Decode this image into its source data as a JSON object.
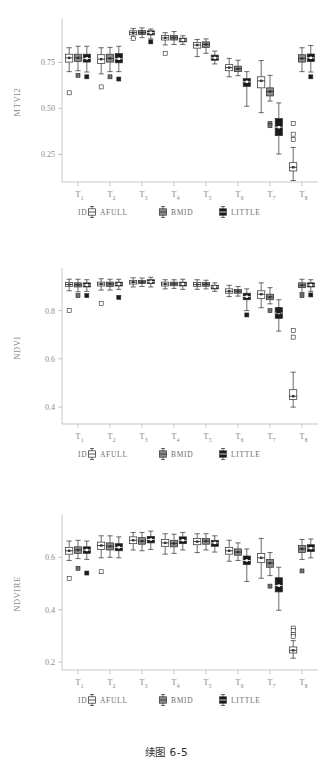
{
  "figure": {
    "caption": "续图 6-5",
    "legend": {
      "title": "ID",
      "items": [
        {
          "label": "AFULL",
          "fill": "#ffffff"
        },
        {
          "label": "BMID",
          "fill": "#8c8c8c"
        },
        {
          "label": "LITTLE",
          "fill": "#1a1a1a"
        }
      ]
    },
    "x_categories": [
      "T",
      "T",
      "T",
      "T",
      "T",
      "T",
      "T",
      "T"
    ],
    "x_subscripts": [
      "1",
      "2",
      "3",
      "4",
      "5",
      "6",
      "7",
      "8"
    ]
  },
  "chart_data": [
    {
      "type": "box",
      "title": "",
      "xlabel": "",
      "ylabel": "MTVI2",
      "ylim": [
        0.1,
        0.97
      ],
      "yticks": [
        0.25,
        0.5,
        0.75
      ],
      "ytick_labels": [
        "0.25",
        "0.50",
        "0.75"
      ],
      "grid": false,
      "legend_position": "bottom",
      "categories": [
        "T1",
        "T2",
        "T3",
        "T4",
        "T5",
        "T6",
        "T7",
        "T8"
      ],
      "series": [
        {
          "name": "AFULL",
          "boxes": [
            {
              "min": 0.7,
              "q1": 0.752,
              "med": 0.775,
              "q3": 0.795,
              "max": 0.83,
              "outliers": [
                0.585
              ]
            },
            {
              "min": 0.688,
              "q1": 0.745,
              "med": 0.768,
              "q3": 0.792,
              "max": 0.83,
              "outliers": [
                0.617
              ]
            },
            {
              "min": 0.88,
              "q1": 0.9,
              "med": 0.912,
              "q3": 0.922,
              "max": 0.935,
              "outliers": [
                0.88
              ]
            },
            {
              "min": 0.845,
              "q1": 0.872,
              "med": 0.884,
              "q3": 0.896,
              "max": 0.912,
              "outliers": [
                0.8
              ]
            },
            {
              "min": 0.782,
              "q1": 0.828,
              "med": 0.845,
              "q3": 0.858,
              "max": 0.875,
              "outliers": []
            },
            {
              "min": 0.672,
              "q1": 0.705,
              "med": 0.722,
              "q3": 0.738,
              "max": 0.772,
              "outliers": []
            },
            {
              "min": 0.477,
              "q1": 0.612,
              "med": 0.65,
              "q3": 0.672,
              "max": 0.76,
              "outliers": []
            },
            {
              "min": 0.108,
              "q1": 0.16,
              "med": 0.18,
              "q3": 0.205,
              "max": 0.288,
              "outliers": [
                0.418,
                0.36,
                0.332
              ]
            }
          ]
        },
        {
          "name": "BMID",
          "boxes": [
            {
              "min": 0.705,
              "q1": 0.755,
              "med": 0.775,
              "q3": 0.795,
              "max": 0.838,
              "outliers": [
                0.68
              ]
            },
            {
              "min": 0.7,
              "q1": 0.752,
              "med": 0.772,
              "q3": 0.795,
              "max": 0.832,
              "outliers": [
                0.672
              ]
            },
            {
              "min": 0.885,
              "q1": 0.902,
              "med": 0.912,
              "q3": 0.924,
              "max": 0.938,
              "outliers": []
            },
            {
              "min": 0.848,
              "q1": 0.872,
              "med": 0.885,
              "q3": 0.896,
              "max": 0.918,
              "outliers": []
            },
            {
              "min": 0.8,
              "q1": 0.832,
              "med": 0.848,
              "q3": 0.862,
              "max": 0.878,
              "outliers": []
            },
            {
              "min": 0.678,
              "q1": 0.7,
              "med": 0.715,
              "q3": 0.73,
              "max": 0.762,
              "outliers": []
            },
            {
              "min": 0.54,
              "q1": 0.568,
              "med": 0.592,
              "q3": 0.612,
              "max": 0.68,
              "outliers": [
                0.418,
                0.406
              ]
            },
            {
              "min": 0.7,
              "q1": 0.752,
              "med": 0.772,
              "q3": 0.792,
              "max": 0.83,
              "outliers": []
            }
          ]
        },
        {
          "name": "LITTLE",
          "boxes": [
            {
              "min": 0.698,
              "q1": 0.752,
              "med": 0.772,
              "q3": 0.795,
              "max": 0.838,
              "outliers": [
                0.672
              ]
            },
            {
              "min": 0.7,
              "q1": 0.748,
              "med": 0.77,
              "q3": 0.798,
              "max": 0.838,
              "outliers": [
                0.66
              ]
            },
            {
              "min": 0.878,
              "q1": 0.9,
              "med": 0.912,
              "q3": 0.922,
              "max": 0.932,
              "outliers": [
                0.862
              ]
            },
            {
              "min": 0.848,
              "q1": 0.862,
              "med": 0.872,
              "q3": 0.882,
              "max": 0.895,
              "outliers": []
            },
            {
              "min": 0.742,
              "q1": 0.762,
              "med": 0.775,
              "q3": 0.79,
              "max": 0.812,
              "outliers": []
            },
            {
              "min": 0.512,
              "q1": 0.62,
              "med": 0.645,
              "q3": 0.662,
              "max": 0.7,
              "outliers": []
            },
            {
              "min": 0.252,
              "q1": 0.352,
              "med": 0.398,
              "q3": 0.445,
              "max": 0.53,
              "outliers": []
            },
            {
              "min": 0.698,
              "q1": 0.755,
              "med": 0.775,
              "q3": 0.796,
              "max": 0.842,
              "outliers": [
                0.672
              ]
            }
          ]
        }
      ]
    },
    {
      "type": "box",
      "title": "",
      "xlabel": "",
      "ylabel": "NDVI",
      "ylim": [
        0.33,
        0.96
      ],
      "yticks": [
        0.4,
        0.6,
        0.8
      ],
      "ytick_labels": [
        "0.4",
        "0.6",
        "0.8"
      ],
      "grid": false,
      "legend_position": "bottom",
      "categories": [
        "T1",
        "T2",
        "T3",
        "T4",
        "T5",
        "T6",
        "T7",
        "T8"
      ],
      "series": [
        {
          "name": "AFULL",
          "boxes": [
            {
              "min": 0.882,
              "q1": 0.9,
              "med": 0.908,
              "q3": 0.916,
              "max": 0.93,
              "outliers": [
                0.8
              ]
            },
            {
              "min": 0.885,
              "q1": 0.902,
              "med": 0.91,
              "q3": 0.918,
              "max": 0.932,
              "outliers": [
                0.83
              ]
            },
            {
              "min": 0.898,
              "q1": 0.91,
              "med": 0.918,
              "q3": 0.925,
              "max": 0.936,
              "outliers": []
            },
            {
              "min": 0.89,
              "q1": 0.902,
              "med": 0.91,
              "q3": 0.918,
              "max": 0.928,
              "outliers": []
            },
            {
              "min": 0.888,
              "q1": 0.9,
              "med": 0.908,
              "q3": 0.916,
              "max": 0.928,
              "outliers": []
            },
            {
              "min": 0.858,
              "q1": 0.872,
              "med": 0.88,
              "q3": 0.89,
              "max": 0.905,
              "outliers": []
            },
            {
              "min": 0.812,
              "q1": 0.85,
              "med": 0.868,
              "q3": 0.882,
              "max": 0.915,
              "outliers": []
            },
            {
              "min": 0.4,
              "q1": 0.432,
              "med": 0.445,
              "q3": 0.472,
              "max": 0.545,
              "outliers": [
                0.718,
                0.69
              ]
            }
          ]
        },
        {
          "name": "BMID",
          "boxes": [
            {
              "min": 0.878,
              "q1": 0.898,
              "med": 0.907,
              "q3": 0.915,
              "max": 0.93,
              "outliers": [
                0.862
              ]
            },
            {
              "min": 0.885,
              "q1": 0.9,
              "med": 0.91,
              "q3": 0.918,
              "max": 0.93,
              "outliers": []
            },
            {
              "min": 0.9,
              "q1": 0.912,
              "med": 0.918,
              "q3": 0.925,
              "max": 0.935,
              "outliers": []
            },
            {
              "min": 0.892,
              "q1": 0.903,
              "med": 0.911,
              "q3": 0.918,
              "max": 0.928,
              "outliers": []
            },
            {
              "min": 0.89,
              "q1": 0.901,
              "med": 0.909,
              "q3": 0.916,
              "max": 0.926,
              "outliers": []
            },
            {
              "min": 0.86,
              "q1": 0.872,
              "med": 0.88,
              "q3": 0.888,
              "max": 0.9,
              "outliers": []
            },
            {
              "min": 0.828,
              "q1": 0.845,
              "med": 0.856,
              "q3": 0.868,
              "max": 0.895,
              "outliers": [
                0.8
              ]
            },
            {
              "min": 0.875,
              "q1": 0.895,
              "med": 0.905,
              "q3": 0.915,
              "max": 0.93,
              "outliers": [
                0.862
              ]
            }
          ]
        },
        {
          "name": "LITTLE",
          "boxes": [
            {
              "min": 0.88,
              "q1": 0.898,
              "med": 0.906,
              "q3": 0.915,
              "max": 0.928,
              "outliers": [
                0.862
              ]
            },
            {
              "min": 0.888,
              "q1": 0.902,
              "med": 0.91,
              "q3": 0.918,
              "max": 0.93,
              "outliers": [
                0.855
              ]
            },
            {
              "min": 0.898,
              "q1": 0.912,
              "med": 0.92,
              "q3": 0.928,
              "max": 0.938,
              "outliers": []
            },
            {
              "min": 0.888,
              "q1": 0.902,
              "med": 0.91,
              "q3": 0.918,
              "max": 0.93,
              "outliers": []
            },
            {
              "min": 0.88,
              "q1": 0.89,
              "med": 0.898,
              "q3": 0.905,
              "max": 0.915,
              "outliers": []
            },
            {
              "min": 0.8,
              "q1": 0.845,
              "med": 0.858,
              "q3": 0.872,
              "max": 0.89,
              "outliers": [
                0.782
              ]
            },
            {
              "min": 0.715,
              "q1": 0.768,
              "med": 0.79,
              "q3": 0.812,
              "max": 0.845,
              "outliers": [
                0.805,
                0.798
              ]
            },
            {
              "min": 0.88,
              "q1": 0.898,
              "med": 0.906,
              "q3": 0.915,
              "max": 0.928,
              "outliers": [
                0.865
              ]
            }
          ]
        }
      ]
    },
    {
      "type": "box",
      "title": "",
      "xlabel": "",
      "ylabel": "NDVIRE",
      "ylim": [
        0.17,
        0.75
      ],
      "yticks": [
        0.2,
        0.4,
        0.6
      ],
      "ytick_labels": [
        "0.2",
        "0.4",
        "0.6"
      ],
      "grid": false,
      "legend_position": "bottom",
      "categories": [
        "T1",
        "T2",
        "T3",
        "T4",
        "T5",
        "T6",
        "T7",
        "T8"
      ],
      "series": [
        {
          "name": "AFULL",
          "boxes": [
            {
              "min": 0.588,
              "q1": 0.612,
              "med": 0.625,
              "q3": 0.638,
              "max": 0.662,
              "outliers": [
                0.52
              ]
            },
            {
              "min": 0.598,
              "q1": 0.63,
              "med": 0.645,
              "q3": 0.658,
              "max": 0.682,
              "outliers": [
                0.545
              ]
            },
            {
              "min": 0.628,
              "q1": 0.652,
              "med": 0.665,
              "q3": 0.678,
              "max": 0.695,
              "outliers": []
            },
            {
              "min": 0.612,
              "q1": 0.642,
              "med": 0.655,
              "q3": 0.668,
              "max": 0.69,
              "outliers": []
            },
            {
              "min": 0.618,
              "q1": 0.648,
              "med": 0.66,
              "q3": 0.672,
              "max": 0.69,
              "outliers": []
            },
            {
              "min": 0.585,
              "q1": 0.612,
              "med": 0.625,
              "q3": 0.638,
              "max": 0.665,
              "outliers": []
            },
            {
              "min": 0.52,
              "q1": 0.58,
              "med": 0.598,
              "q3": 0.615,
              "max": 0.672,
              "outliers": []
            },
            {
              "min": 0.215,
              "q1": 0.235,
              "med": 0.245,
              "q3": 0.258,
              "max": 0.282,
              "outliers": [
                0.33,
                0.32,
                0.305,
                0.298
              ]
            }
          ]
        },
        {
          "name": "BMID",
          "boxes": [
            {
              "min": 0.595,
              "q1": 0.615,
              "med": 0.628,
              "q3": 0.64,
              "max": 0.665,
              "outliers": [
                0.558
              ]
            },
            {
              "min": 0.6,
              "q1": 0.628,
              "med": 0.642,
              "q3": 0.655,
              "max": 0.682,
              "outliers": []
            },
            {
              "min": 0.625,
              "q1": 0.65,
              "med": 0.662,
              "q3": 0.675,
              "max": 0.695,
              "outliers": []
            },
            {
              "min": 0.615,
              "q1": 0.64,
              "med": 0.653,
              "q3": 0.665,
              "max": 0.688,
              "outliers": []
            },
            {
              "min": 0.628,
              "q1": 0.65,
              "med": 0.662,
              "q3": 0.672,
              "max": 0.69,
              "outliers": []
            },
            {
              "min": 0.588,
              "q1": 0.608,
              "med": 0.62,
              "q3": 0.632,
              "max": 0.655,
              "outliers": []
            },
            {
              "min": 0.53,
              "q1": 0.562,
              "med": 0.578,
              "q3": 0.592,
              "max": 0.618,
              "outliers": [
                0.49
              ]
            },
            {
              "min": 0.592,
              "q1": 0.618,
              "med": 0.632,
              "q3": 0.645,
              "max": 0.668,
              "outliers": [
                0.548
              ]
            }
          ]
        },
        {
          "name": "LITTLE",
          "boxes": [
            {
              "min": 0.592,
              "q1": 0.615,
              "med": 0.628,
              "q3": 0.64,
              "max": 0.662,
              "outliers": [
                0.54
              ]
            },
            {
              "min": 0.598,
              "q1": 0.625,
              "med": 0.638,
              "q3": 0.652,
              "max": 0.678,
              "outliers": []
            },
            {
              "min": 0.63,
              "q1": 0.655,
              "med": 0.668,
              "q3": 0.68,
              "max": 0.7,
              "outliers": []
            },
            {
              "min": 0.628,
              "q1": 0.652,
              "med": 0.665,
              "q3": 0.678,
              "max": 0.695,
              "outliers": []
            },
            {
              "min": 0.62,
              "q1": 0.642,
              "med": 0.655,
              "q3": 0.665,
              "max": 0.682,
              "outliers": []
            },
            {
              "min": 0.508,
              "q1": 0.572,
              "med": 0.588,
              "q3": 0.605,
              "max": 0.632,
              "outliers": []
            },
            {
              "min": 0.398,
              "q1": 0.468,
              "med": 0.492,
              "q3": 0.522,
              "max": 0.562,
              "outliers": []
            },
            {
              "min": 0.598,
              "q1": 0.622,
              "med": 0.635,
              "q3": 0.648,
              "max": 0.67,
              "outliers": []
            }
          ]
        }
      ]
    }
  ]
}
